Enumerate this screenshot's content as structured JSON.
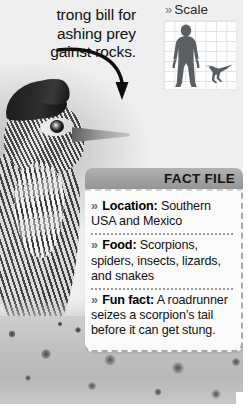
{
  "caption": {
    "text": "trong bill for ashing prey gainst rocks.",
    "line1": "trong bill for",
    "line2": "ashing prey",
    "line3": "gainst rocks."
  },
  "scale": {
    "title": "Scale",
    "chevron": "»",
    "figures": [
      "human-silhouette",
      "roadrunner-silhouette"
    ]
  },
  "fact_file": {
    "title": "FACT FILE",
    "chevron": "»",
    "entries": [
      {
        "label": "Location:",
        "value": "Southern USA and Mexico"
      },
      {
        "label": "Food:",
        "value": "Scorpions, spiders, insects, lizards, and snakes"
      },
      {
        "label": "Fun fact:",
        "value": "A roadrunner seizes a scorpion’s tail before it can get stung."
      }
    ]
  },
  "photo": {
    "subject": "greater-roadrunner",
    "ground": "gravel"
  },
  "colors": {
    "header_gray": "#a0a0a0",
    "panel_bg": "#fbfbfb",
    "dashed_border": "#a9a9a9",
    "text": "#121212",
    "grid_line": "#dfe4e8",
    "silhouette": "#5a5f63"
  }
}
